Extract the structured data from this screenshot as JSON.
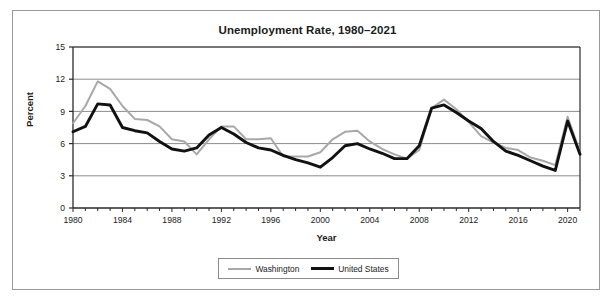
{
  "figure": {
    "title": "Unemployment Rate, 1980–2021",
    "xlabel": "Year",
    "ylabel": "Percent"
  },
  "legend": {
    "washington_label": "Washington",
    "united_states_label": "United States"
  },
  "colors": {
    "washington": "#a8a8a8",
    "united_states": "#111111",
    "gridline": "#8c8c8c",
    "axis": "#2b2b2b",
    "frame": "#9a9a9a",
    "text": "#1b1b1b"
  },
  "chart_data": {
    "type": "line",
    "title": "Unemployment Rate, 1980–2021",
    "xlabel": "Year",
    "ylabel": "Percent",
    "xlim": [
      1980,
      2021
    ],
    "ylim": [
      0,
      15
    ],
    "yticks": [
      0,
      3,
      6,
      9,
      12,
      15
    ],
    "xticks": [
      1980,
      1984,
      1988,
      1992,
      1996,
      2000,
      2004,
      2008,
      2012,
      2016,
      2020
    ],
    "xtick_labels": [
      "1980",
      "1984",
      "1988",
      "1992",
      "1996",
      "2000",
      "2004",
      "2008",
      "2012",
      "2016",
      "2020"
    ],
    "ytick_labels": [
      "0",
      "3",
      "6",
      "9",
      "12",
      "15"
    ],
    "grid": "horizontal",
    "legend_position": "bottom-center",
    "x": [
      1980,
      1981,
      1982,
      1983,
      1984,
      1985,
      1986,
      1987,
      1988,
      1989,
      1990,
      1991,
      1992,
      1993,
      1994,
      1995,
      1996,
      1997,
      1998,
      1999,
      2000,
      2001,
      2002,
      2003,
      2004,
      2005,
      2006,
      2007,
      2008,
      2009,
      2010,
      2011,
      2012,
      2013,
      2014,
      2015,
      2016,
      2017,
      2018,
      2019,
      2020,
      2021
    ],
    "series": [
      {
        "name": "Washington",
        "color": "#a8a8a8",
        "values": [
          7.9,
          9.5,
          11.8,
          11.1,
          9.5,
          8.3,
          8.2,
          7.6,
          6.4,
          6.2,
          5.0,
          6.4,
          7.6,
          7.6,
          6.4,
          6.4,
          6.5,
          4.8,
          4.8,
          4.8,
          5.2,
          6.4,
          7.1,
          7.2,
          6.2,
          5.5,
          5.0,
          4.6,
          5.4,
          9.3,
          10.1,
          9.2,
          8.0,
          6.7,
          6.1,
          5.6,
          5.4,
          4.7,
          4.4,
          4.0,
          8.5,
          5.2
        ]
      },
      {
        "name": "United States",
        "color": "#111111",
        "values": [
          7.1,
          7.6,
          9.7,
          9.6,
          7.5,
          7.2,
          7.0,
          6.2,
          5.5,
          5.3,
          5.6,
          6.8,
          7.5,
          6.9,
          6.1,
          5.6,
          5.4,
          4.9,
          4.5,
          4.2,
          3.8,
          4.7,
          5.8,
          6.0,
          5.5,
          5.1,
          4.6,
          4.6,
          5.8,
          9.3,
          9.6,
          8.9,
          8.1,
          7.4,
          6.2,
          5.3,
          4.9,
          4.4,
          3.9,
          3.5,
          8.1,
          5.0
        ]
      }
    ]
  }
}
